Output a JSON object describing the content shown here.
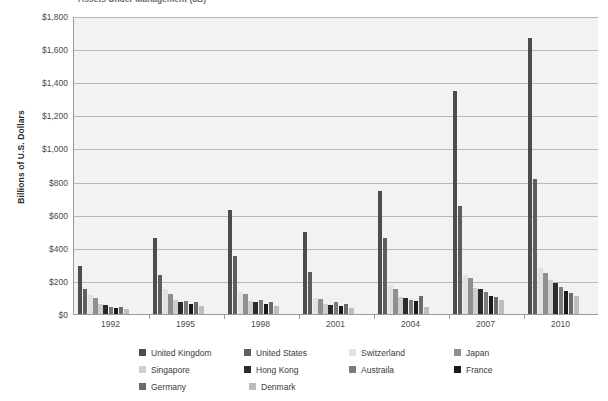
{
  "title": "Assets Under Management ($B)",
  "y_axis_title": "Billions of U.S. Dollars",
  "y_ticks": [
    "$1,800",
    "$1,600",
    "$1,400",
    "$1,200",
    "$1,000",
    "$800",
    "$600",
    "$400",
    "$200",
    "$0"
  ],
  "x_ticks": [
    "1992",
    "1995",
    "1998",
    "2001",
    "2004",
    "2007",
    "2010"
  ],
  "legend": {
    "items": [
      {
        "label": "United Kingdom",
        "color": "#4d4d4d"
      },
      {
        "label": "United States",
        "color": "#5e5e5e"
      },
      {
        "label": "Switzerland",
        "color": "#e2e2e2"
      },
      {
        "label": "Japan",
        "color": "#8f8f8f"
      },
      {
        "label": "Singapore",
        "color": "#cfcfcf"
      },
      {
        "label": "Hong Kong",
        "color": "#2b2b2b"
      },
      {
        "label": "Austraila",
        "color": "#7a7a7a"
      },
      {
        "label": "France",
        "color": "#1a1a1a"
      },
      {
        "label": "Germany",
        "color": "#6b6b6b"
      },
      {
        "label": "Denmark",
        "color": "#bdbdbd"
      }
    ]
  },
  "chart_data": {
    "type": "bar",
    "title": "Assets Under Management ($B)",
    "xlabel": "",
    "ylabel": "Billions of U.S. Dollars",
    "ylim": [
      0,
      1800
    ],
    "ytick_step": 200,
    "grid": true,
    "legend_position": "bottom",
    "categories": [
      "1992",
      "1995",
      "1998",
      "2001",
      "2004",
      "2007",
      "2010"
    ],
    "series": [
      {
        "name": "United Kingdom",
        "color": "#4d4d4d",
        "values": [
          290,
          460,
          630,
          495,
          745,
          1345,
          1665
        ]
      },
      {
        "name": "United States",
        "color": "#5e5e5e",
        "values": [
          150,
          235,
          350,
          255,
          460,
          650,
          815
        ]
      },
      {
        "name": "Switzerland",
        "color": "#e2e2e2",
        "values": [
          115,
          150,
          130,
          95,
          175,
          235,
          280
        ]
      },
      {
        "name": "Japan",
        "color": "#8f8f8f",
        "values": [
          95,
          120,
          120,
          90,
          150,
          215,
          250
        ]
      },
      {
        "name": "Singapore",
        "color": "#cfcfcf",
        "values": [
          60,
          85,
          80,
          60,
          100,
          160,
          205
        ]
      },
      {
        "name": "Hong Kong",
        "color": "#2b2b2b",
        "values": [
          55,
          75,
          70,
          55,
          95,
          150,
          190
        ]
      },
      {
        "name": "Austraila",
        "color": "#7a7a7a",
        "values": [
          45,
          80,
          85,
          70,
          85,
          135,
          165
        ]
      },
      {
        "name": "France",
        "color": "#1a1a1a",
        "values": [
          35,
          60,
          60,
          50,
          80,
          110,
          140
        ]
      },
      {
        "name": "Germany",
        "color": "#6b6b6b",
        "values": [
          40,
          70,
          75,
          60,
          110,
          100,
          125
        ]
      },
      {
        "name": "Denmark",
        "color": "#bdbdbd",
        "values": [
          30,
          50,
          50,
          35,
          45,
          85,
          110
        ]
      }
    ]
  }
}
